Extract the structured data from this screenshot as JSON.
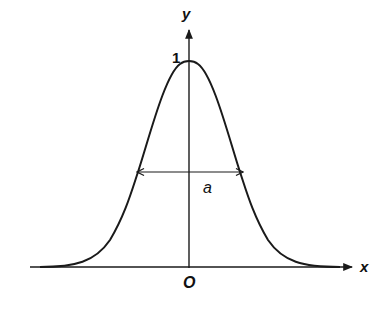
{
  "diagram": {
    "type": "gaussian-curve",
    "labels": {
      "x_axis": "x",
      "y_axis": "y",
      "origin": "O",
      "peak": "1",
      "width": "a"
    },
    "colors": {
      "stroke": "#1a1a1a",
      "background": "#ffffff"
    }
  }
}
